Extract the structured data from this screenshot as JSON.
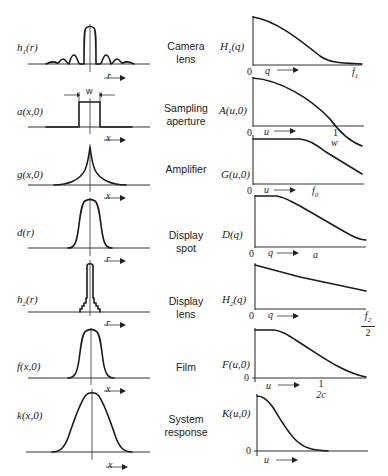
{
  "stages": [
    {
      "name": "Camera lens",
      "line1": "Camera",
      "line2": "lens",
      "spatial_label": "h1(r)",
      "spatial_sym": "h",
      "spatial_sub": "1",
      "spatial_arg": "(r)",
      "spatial_axis": "r",
      "freq_label": "H1(q)",
      "freq_sym": "H",
      "freq_sub": "1",
      "freq_arg": "(q)",
      "freq_axis": "q",
      "freq_tick": "f1",
      "freq_tick_sym": "f",
      "freq_tick_sub": "1",
      "origin": "0"
    },
    {
      "name": "Sampling aperture",
      "line1": "Sampling",
      "line2": "aperture",
      "spatial_label": "a(x,0)",
      "spatial_axis": "x",
      "width_marker": "w",
      "freq_label": "A(u,0)",
      "freq_axis": "u",
      "freq_tick": "1",
      "freq_tick2": "w",
      "origin": "0"
    },
    {
      "name": "Amplifier",
      "line1": "Amplifier",
      "line2": "",
      "spatial_label": "g(x,0)",
      "spatial_axis": "x",
      "freq_label": "G(u,0)",
      "freq_axis": "u",
      "freq_tick": "f0",
      "freq_tick_sym": "f",
      "freq_tick_sub": "0",
      "origin": "0"
    },
    {
      "name": "Display spot",
      "line1": "Display",
      "line2": "spot",
      "spatial_label": "d(r)",
      "spatial_axis": "r",
      "freq_label": "D(q)",
      "freq_axis": "q",
      "freq_tick": "a",
      "origin": "0"
    },
    {
      "name": "Display lens",
      "line1": "Display",
      "line2": "lens",
      "spatial_label": "h2(r)",
      "spatial_sym": "h",
      "spatial_sub": "2",
      "spatial_arg": "(r)",
      "spatial_axis": "r",
      "freq_label": "H2(q)",
      "freq_sym": "H",
      "freq_sub": "2",
      "freq_arg": "(q)",
      "freq_axis": "q",
      "freq_tick_num": "f2",
      "freq_tick_num_sym": "f",
      "freq_tick_num_sub": "2",
      "freq_tick_den": "2",
      "origin": "0"
    },
    {
      "name": "Film",
      "line1": "Film",
      "line2": "",
      "spatial_label": "f(x,0)",
      "spatial_axis": "x",
      "freq_label": "F(u,0)",
      "freq_axis": "u",
      "freq_tick_num": "1",
      "freq_tick_den": "2c",
      "origin": "0"
    },
    {
      "name": "System response",
      "line1": "System",
      "line2": "response",
      "spatial_label": "k(x,0)",
      "spatial_axis": "x",
      "freq_label": "K(u,0)",
      "freq_axis": "u",
      "origin": "0"
    }
  ],
  "arrow_glyph": "→"
}
